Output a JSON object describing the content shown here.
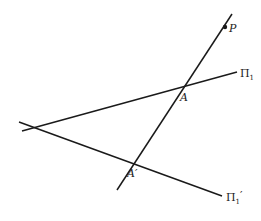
{
  "diagram": {
    "labels": {
      "point_p": "P",
      "point_a": "A",
      "point_a_prime": "A′",
      "plane_pi1": "Π",
      "plane_pi1_sub": "1",
      "plane_pi1_prime": "Π",
      "plane_pi1_prime_sub": "1",
      "plane_pi1_prime_mark": "′"
    },
    "lines": [
      {
        "name": "line-through-p",
        "from": [
          232,
          14
        ],
        "to": [
          117,
          190
        ]
      },
      {
        "name": "plane-pi1-trace",
        "from": [
          22,
          131
        ],
        "to": [
          237,
          72
        ]
      },
      {
        "name": "plane-pi1-prime-trace",
        "from": [
          19,
          122
        ],
        "to": [
          222,
          196
        ]
      }
    ],
    "points": [
      {
        "name": "P",
        "at": [
          225,
          27
        ]
      },
      {
        "name": "A",
        "at": [
          182,
          88
        ]
      },
      {
        "name": "A′",
        "at": [
          133,
          162
        ]
      }
    ],
    "colors": {
      "line": "#1a1a1a",
      "text": "#222222",
      "background": "#ffffff"
    }
  }
}
